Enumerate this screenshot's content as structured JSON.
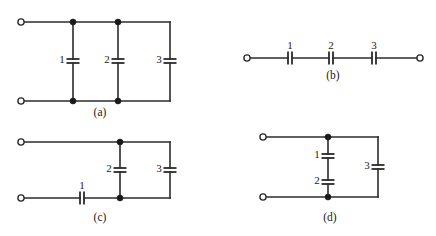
{
  "figure": {
    "background_color": "#ffffff",
    "line_color": "#2b2b2b",
    "node_color": "#1a1a1a",
    "width": 436,
    "height": 236
  },
  "circuits": [
    {
      "id": "a",
      "caption": "(a)",
      "caption_x": 100,
      "caption_y": 113,
      "description": "three capacitors in parallel",
      "terminals": [
        {
          "name": "terminal-top-left",
          "x": 21,
          "y": 22
        },
        {
          "name": "terminal-bottom-left",
          "x": 21,
          "y": 101
        }
      ],
      "nodes": [
        {
          "name": "node-top-1",
          "x": 73,
          "y": 22
        },
        {
          "name": "node-top-2",
          "x": 118,
          "y": 22
        },
        {
          "name": "node-bottom-1",
          "x": 73,
          "y": 101
        },
        {
          "name": "node-bottom-2",
          "x": 118,
          "y": 101
        }
      ],
      "capacitors": [
        {
          "label": "1",
          "orientation": "vertical",
          "x": 73,
          "y": 61,
          "label_x": 62,
          "label_y": 60
        },
        {
          "label": "2",
          "orientation": "vertical",
          "x": 118,
          "y": 61,
          "label_x": 107,
          "label_y": 60
        },
        {
          "label": "3",
          "orientation": "vertical",
          "x": 170,
          "y": 61,
          "label_x": 159,
          "label_y": 60
        }
      ]
    },
    {
      "id": "b",
      "caption": "(b)",
      "caption_x": 333,
      "caption_y": 76,
      "description": "three capacitors in series",
      "terminals": [
        {
          "name": "terminal-left",
          "x": 247,
          "y": 58
        },
        {
          "name": "terminal-right",
          "x": 420,
          "y": 58
        }
      ],
      "nodes": [],
      "capacitors": [
        {
          "label": "1",
          "orientation": "horizontal",
          "x": 290,
          "y": 58,
          "label_x": 290,
          "label_y": 46
        },
        {
          "label": "2",
          "orientation": "horizontal",
          "x": 331,
          "y": 58,
          "label_x": 331,
          "label_y": 46
        },
        {
          "label": "3",
          "orientation": "horizontal",
          "x": 374,
          "y": 58,
          "label_x": 374,
          "label_y": 46
        }
      ]
    },
    {
      "id": "c",
      "caption": "(c)",
      "caption_x": 100,
      "caption_y": 218,
      "description": "capacitor 1 in series with parallel pair 2 and 3",
      "terminals": [
        {
          "name": "terminal-top-left",
          "x": 21,
          "y": 142
        },
        {
          "name": "terminal-bottom-left",
          "x": 21,
          "y": 198
        }
      ],
      "nodes": [
        {
          "name": "node-top",
          "x": 120,
          "y": 142
        },
        {
          "name": "node-bottom",
          "x": 120,
          "y": 198
        }
      ],
      "capacitors": [
        {
          "label": "1",
          "orientation": "horizontal",
          "x": 82,
          "y": 198,
          "label_x": 82,
          "label_y": 186
        },
        {
          "label": "2",
          "orientation": "vertical",
          "x": 120,
          "y": 170,
          "label_x": 109,
          "label_y": 169
        },
        {
          "label": "3",
          "orientation": "vertical",
          "x": 170,
          "y": 170,
          "label_x": 159,
          "label_y": 169
        }
      ]
    },
    {
      "id": "d",
      "caption": "(d)",
      "caption_x": 330,
      "caption_y": 218,
      "description": "capacitors 1 and 2 in series, in parallel with capacitor 3",
      "terminals": [
        {
          "name": "terminal-top-left",
          "x": 263,
          "y": 137
        },
        {
          "name": "terminal-bottom-left",
          "x": 263,
          "y": 197
        }
      ],
      "nodes": [
        {
          "name": "node-top",
          "x": 328,
          "y": 137
        },
        {
          "name": "node-bottom",
          "x": 328,
          "y": 197
        }
      ],
      "capacitors": [
        {
          "label": "1",
          "orientation": "vertical",
          "x": 328,
          "y": 156,
          "label_x": 317,
          "label_y": 155
        },
        {
          "label": "2",
          "orientation": "vertical",
          "x": 328,
          "y": 182,
          "label_x": 317,
          "label_y": 181
        },
        {
          "label": "3",
          "orientation": "vertical",
          "x": 378,
          "y": 167,
          "label_x": 367,
          "label_y": 166
        }
      ]
    }
  ]
}
